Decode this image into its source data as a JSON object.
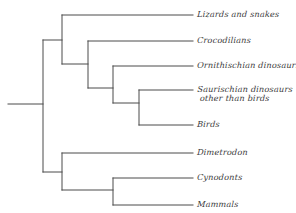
{
  "diagram": {
    "type": "cladogram",
    "title": "",
    "background_color": "#ffffff",
    "line_color": "#4a4a4a",
    "text_color": "#3b3b3b",
    "root_label": "",
    "tips": [
      {
        "id": "lizards",
        "label": "Lizards and snakes",
        "y": 15,
        "label_x": 197
      },
      {
        "id": "crocodilians",
        "label": "Crocodilians",
        "y": 41,
        "label_x": 197
      },
      {
        "id": "ornithischian",
        "label": "Ornithischian dinosaurs",
        "y": 66,
        "label_x": 197
      },
      {
        "id": "saurischian",
        "label": "Saurischian dinosaurs",
        "label_line2": "other than birds",
        "y": 90,
        "label_x": 197
      },
      {
        "id": "birds",
        "label": "Birds",
        "y": 125,
        "label_x": 197
      },
      {
        "id": "dimetrodon",
        "label": "Dimetrodon",
        "y": 153,
        "label_x": 197
      },
      {
        "id": "cynodonts",
        "label": "Cynodonts",
        "y": 178,
        "label_x": 197
      },
      {
        "id": "mammals",
        "label": "Mammals",
        "y": 205,
        "label_x": 197
      }
    ],
    "nodes": [
      {
        "id": "root",
        "x": 43,
        "y_top": 40,
        "y_bottom": 172,
        "stem_from_x": 8,
        "stem_y": 104
      },
      {
        "id": "diapsids",
        "x": 62,
        "y_top": 15,
        "y_bottom": 64
      },
      {
        "id": "archosaurs",
        "x": 88,
        "y_top": 41,
        "y_bottom": 88
      },
      {
        "id": "dinosaurs",
        "x": 113,
        "y_top": 66,
        "y_bottom": 103
      },
      {
        "id": "saurischians",
        "x": 139,
        "y_top": 90,
        "y_bottom": 125
      },
      {
        "id": "synapsids",
        "x": 62,
        "y_top": 153,
        "y_bottom": 190
      },
      {
        "id": "cynodont-mammal",
        "x": 113,
        "y_top": 178,
        "y_bottom": 205
      }
    ],
    "tip_line_end_x": 193
  }
}
